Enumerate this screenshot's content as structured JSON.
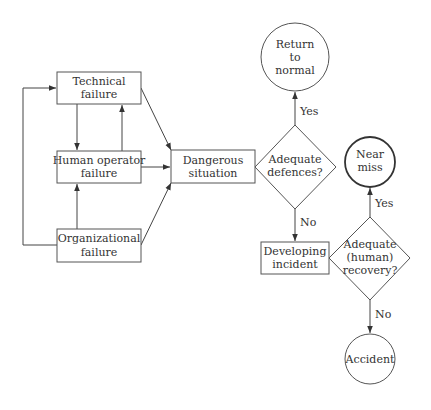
{
  "diagram": {
    "nodes": {
      "technical_failure": {
        "line1": "Technical",
        "line2": "failure"
      },
      "human_operator_failure": {
        "line1": "Human operator",
        "line2": "failure"
      },
      "organizational_failure": {
        "line1": "Organizational",
        "line2": "failure"
      },
      "dangerous_situation": {
        "line1": "Dangerous",
        "line2": "situation"
      },
      "adequate_defences": {
        "line1": "Adequate",
        "line2": "defences?"
      },
      "return_to_normal": {
        "line1": "Return",
        "line2": "to",
        "line3": "normal"
      },
      "developing_incident": {
        "line1": "Developing",
        "line2": "incident"
      },
      "adequate_human_recovery": {
        "line1": "Adequate",
        "line2": "(human)",
        "line3": "recovery?"
      },
      "near_miss": {
        "line1": "Near",
        "line2": "miss"
      },
      "accident": {
        "line1": "Accident"
      }
    },
    "edge_labels": {
      "defences_yes": "Yes",
      "defences_no": "No",
      "recovery_yes": "Yes",
      "recovery_no": "No"
    },
    "colors": {
      "line": "#444444",
      "text": "#333333",
      "background": "#ffffff"
    }
  }
}
